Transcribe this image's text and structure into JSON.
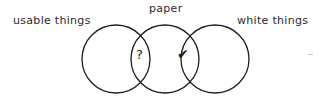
{
  "diagram": {
    "type": "venn",
    "title": "",
    "background_color": "#ffffff",
    "stroke_color": "#1f1f1f",
    "text_color": "#2b2b2b",
    "labels": {
      "left": "usable things",
      "top": "paper",
      "right": "white things"
    },
    "symbols": {
      "left_intersection": "?",
      "right_intersection": "✔"
    },
    "circles": [
      {
        "name": "usable things",
        "cx": 116,
        "cy": 59,
        "r": 34
      },
      {
        "name": "paper",
        "cx": 165,
        "cy": 59,
        "r": 34
      },
      {
        "name": "white things",
        "cx": 215,
        "cy": 59,
        "r": 34
      }
    ]
  }
}
